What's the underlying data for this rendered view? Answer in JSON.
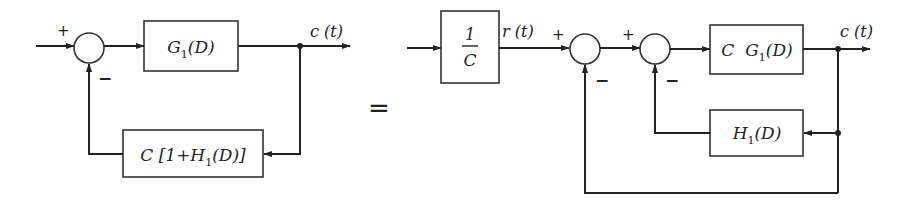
{
  "diagram": {
    "equals_sign": "=",
    "left": {
      "blocks": {
        "forward": {
          "prefix": "G",
          "sub": "1",
          "suffix": "(D)",
          "text": "G1(D)"
        },
        "feedback": {
          "prefix": "C [1+H",
          "sub": "1",
          "suffix": "(D)]",
          "text": "C[1+H1(D)]"
        }
      },
      "summing_junction": {
        "input_sign": "+",
        "feedback_sign": "−"
      },
      "output_label": "c (t)"
    },
    "right": {
      "blocks": {
        "prefilter": {
          "numerator": "1",
          "denominator": "C",
          "text": "1/C"
        },
        "forward": {
          "prefix": "C  G",
          "sub": "1",
          "suffix": "(D)",
          "text": "C G1(D)"
        },
        "inner_feedback": {
          "prefix": "H",
          "sub": "1",
          "suffix": "(D)",
          "text": "H1(D)"
        }
      },
      "summing_junction_1": {
        "input_sign": "+",
        "feedback_sign": "−"
      },
      "summing_junction_2": {
        "input_sign": "+",
        "feedback_sign": "−"
      },
      "intermediate_label": "r (t)",
      "output_label": "c (t)"
    }
  }
}
